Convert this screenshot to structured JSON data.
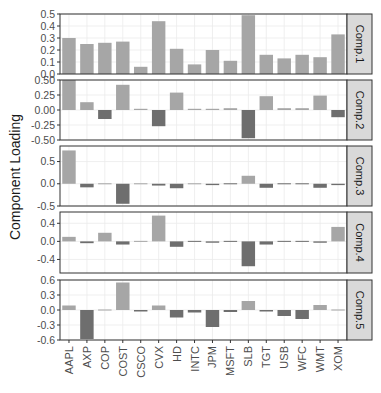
{
  "chart_data": {
    "type": "bar",
    "title": "",
    "xlabel": "",
    "ylabel": "Component Loading",
    "grid": true,
    "legend": "none",
    "categories": [
      "AAPL",
      "AXP",
      "COP",
      "COST",
      "CSCO",
      "CVX",
      "HD",
      "INTC",
      "JPM",
      "MSFT",
      "SLB",
      "TGT",
      "USB",
      "WFC",
      "WMT",
      "XOM"
    ],
    "panels": [
      {
        "name": "Comp.1",
        "ylim": [
          0,
          0.5
        ],
        "ticks": [
          "0.5",
          "0.4",
          "0.3",
          "0.2",
          "0.1",
          "0.0"
        ],
        "tick_values": [
          0.5,
          0.4,
          0.3,
          0.2,
          0.1,
          0.0
        ],
        "values": [
          0.3,
          0.25,
          0.26,
          0.27,
          0.06,
          0.44,
          0.21,
          0.08,
          0.2,
          0.11,
          0.49,
          0.16,
          0.13,
          0.16,
          0.14,
          0.33
        ]
      },
      {
        "name": "Comp.2",
        "ylim": [
          -0.5,
          0.5
        ],
        "ticks": [
          "0.50",
          "0.25",
          "0.00",
          "-0.25",
          "-0.50"
        ],
        "tick_values": [
          0.5,
          0.25,
          0,
          -0.25,
          -0.5
        ],
        "values": [
          0.5,
          0.13,
          -0.15,
          0.42,
          0.02,
          -0.27,
          0.29,
          0.02,
          0.02,
          0.03,
          -0.47,
          0.23,
          0.03,
          0.03,
          0.24,
          -0.12
        ]
      },
      {
        "name": "Comp.3",
        "ylim": [
          -0.5,
          0.85
        ],
        "ticks": [
          "0.5",
          "0.0",
          "-0.5"
        ],
        "tick_values": [
          0.5,
          0,
          -0.5
        ],
        "values": [
          0.75,
          -0.08,
          0.0,
          -0.45,
          0.0,
          -0.04,
          -0.1,
          0.0,
          -0.03,
          -0.01,
          0.18,
          -0.09,
          -0.02,
          -0.01,
          -0.09,
          -0.03
        ]
      },
      {
        "name": "Comp.4",
        "ylim": [
          -0.7,
          0.65
        ],
        "ticks": [
          "0.4",
          "0.0",
          "-0.4"
        ],
        "tick_values": [
          0.4,
          0,
          -0.4
        ],
        "values": [
          0.1,
          -0.04,
          0.19,
          -0.07,
          0.0,
          0.57,
          -0.12,
          -0.01,
          -0.03,
          -0.01,
          -0.55,
          -0.07,
          -0.01,
          -0.01,
          -0.03,
          0.32
        ]
      },
      {
        "name": "Comp.5",
        "ylim": [
          -0.6,
          0.6
        ],
        "ticks": [
          "0.6",
          "0.3",
          "0.0",
          "-0.3",
          "-0.6"
        ],
        "tick_values": [
          0.6,
          0.3,
          0,
          -0.3,
          -0.6
        ],
        "values": [
          0.09,
          -0.58,
          0.0,
          0.55,
          -0.03,
          0.09,
          -0.15,
          -0.05,
          -0.34,
          -0.04,
          0.18,
          -0.03,
          -0.12,
          -0.18,
          0.1,
          0.0
        ]
      }
    ],
    "colors": {
      "positive": "#a6a6a6",
      "negative": "#6e6e6e",
      "strip_fill": "#d9d9d9",
      "grid": "#ebebeb",
      "border": "#333333",
      "text": "#4d4d4d"
    }
  }
}
